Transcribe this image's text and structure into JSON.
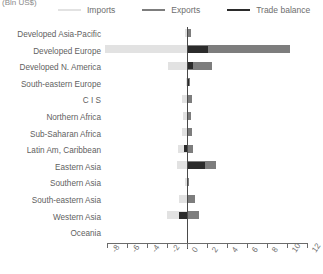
{
  "unit_label": "(Bln US$)",
  "legend": {
    "items": [
      {
        "label": "Imports",
        "color": "#e2e2e2",
        "name": "imports"
      },
      {
        "label": "Exports",
        "color": "#7d7d7d",
        "name": "exports"
      },
      {
        "label": "Trade balance",
        "color": "#2b2b2b",
        "name": "trade-balance"
      }
    ]
  },
  "chart_data": {
    "type": "bar",
    "orientation": "horizontal",
    "title": "",
    "subtitle": "",
    "xlabel": "(Bln US$)",
    "ylabel": "",
    "xlim": [
      -8,
      12
    ],
    "xticks": [
      -8,
      -6,
      -4,
      -2,
      0,
      2,
      4,
      6,
      8,
      10,
      12
    ],
    "xtick_labels": [
      "-8",
      "-6",
      "-4",
      "-2",
      "0",
      "2",
      "4",
      "6",
      "8",
      "10",
      "12"
    ],
    "grid": false,
    "legend_position": "top",
    "categories": [
      "Developed Asia-Pacific",
      "Developed Europe",
      "Developed N. America",
      "South-eastern Europe",
      "C I S",
      "Northern Africa",
      "Sub-Saharan Africa",
      "Latin Am, Caribbean",
      "Eastern Asia",
      "Southern Asia",
      "South-eastern Asia",
      "Western Asia",
      "Oceania"
    ],
    "series": [
      {
        "name": "Imports",
        "color": "#e2e2e2",
        "values": [
          -0.25,
          -8.2,
          -1.9,
          -0.1,
          -0.55,
          -0.4,
          -0.55,
          -0.9,
          -1.05,
          -0.2,
          -0.8,
          -2.0,
          -0.05
        ]
      },
      {
        "name": "Exports",
        "color": "#7d7d7d",
        "values": [
          0.35,
          10.3,
          2.5,
          0.25,
          0.5,
          0.35,
          0.5,
          0.6,
          2.85,
          0.2,
          0.75,
          1.15,
          0.05
        ]
      },
      {
        "name": "Trade balance",
        "color": "#2b2b2b",
        "values": [
          0.1,
          2.1,
          0.6,
          0.15,
          -0.05,
          -0.05,
          -0.05,
          -0.3,
          1.8,
          0.0,
          -0.05,
          -0.85,
          0.0
        ]
      }
    ]
  }
}
